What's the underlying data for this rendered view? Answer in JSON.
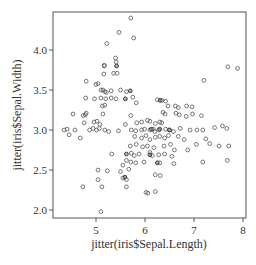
{
  "chart_data": {
    "type": "scatter",
    "title": "",
    "xlabel": "jitter(iris$Sepal.Length)",
    "ylabel": "jitter(iris$Sepal.Width)",
    "xlim": [
      4.15,
      8.06
    ],
    "ylim": [
      1.9,
      4.48
    ],
    "x_ticks": [
      5,
      6,
      7,
      8
    ],
    "x_tick_labels": [
      "5",
      "6",
      "7",
      "8"
    ],
    "y_ticks": [
      2.0,
      2.5,
      3.0,
      3.5,
      4.0
    ],
    "y_tick_labels": [
      "2.0",
      "2.5",
      "3.0",
      "3.5",
      "4.0"
    ],
    "grid": false,
    "legend": null,
    "marker": "open-circle",
    "marker_color": "#555555",
    "points": [
      [
        5.71,
        4.4
      ],
      [
        5.47,
        4.22
      ],
      [
        5.22,
        4.08
      ],
      [
        5.77,
        4.15
      ],
      [
        5.4,
        3.9
      ],
      [
        5.41,
        3.85
      ],
      [
        5.17,
        3.8
      ],
      [
        5.17,
        3.81
      ],
      [
        5.16,
        3.7
      ],
      [
        5.36,
        3.71
      ],
      [
        5.43,
        3.71
      ],
      [
        7.69,
        3.79
      ],
      [
        7.89,
        3.77
      ],
      [
        7.2,
        3.62
      ],
      [
        4.8,
        3.61
      ],
      [
        5.0,
        3.57
      ],
      [
        5.04,
        3.58
      ],
      [
        5.1,
        3.5
      ],
      [
        5.14,
        3.5
      ],
      [
        5.18,
        3.48
      ],
      [
        5.21,
        3.47
      ],
      [
        5.31,
        3.49
      ],
      [
        5.5,
        3.5
      ],
      [
        5.62,
        3.48
      ],
      [
        4.79,
        3.4
      ],
      [
        4.97,
        3.39
      ],
      [
        5.1,
        3.4
      ],
      [
        5.2,
        3.39
      ],
      [
        5.31,
        3.4
      ],
      [
        5.41,
        3.39
      ],
      [
        5.13,
        3.3
      ],
      [
        5.18,
        3.31
      ],
      [
        5.75,
        3.41
      ],
      [
        5.82,
        3.34
      ],
      [
        6.25,
        3.38
      ],
      [
        6.35,
        3.37
      ],
      [
        6.42,
        3.36
      ],
      [
        6.47,
        3.3
      ],
      [
        6.62,
        3.3
      ],
      [
        6.68,
        3.28
      ],
      [
        6.85,
        3.3
      ],
      [
        6.96,
        3.29
      ],
      [
        4.53,
        3.2
      ],
      [
        4.74,
        3.18
      ],
      [
        4.78,
        3.19
      ],
      [
        4.8,
        3.21
      ],
      [
        4.76,
        3.09
      ],
      [
        4.96,
        3.1
      ],
      [
        5.02,
        3.11
      ],
      [
        5.08,
        3.07
      ],
      [
        5.14,
        3.2
      ],
      [
        5.71,
        3.18
      ],
      [
        6.37,
        3.22
      ],
      [
        6.41,
        3.2
      ],
      [
        6.63,
        3.21
      ],
      [
        6.7,
        3.19
      ],
      [
        6.84,
        3.17
      ],
      [
        6.97,
        3.2
      ],
      [
        7.15,
        3.18
      ],
      [
        4.35,
        3.0
      ],
      [
        4.41,
        3.01
      ],
      [
        4.45,
        2.94
      ],
      [
        4.57,
        3.0
      ],
      [
        4.68,
        2.9
      ],
      [
        4.87,
        3.0
      ],
      [
        4.94,
        3.02
      ],
      [
        5.01,
        3.0
      ],
      [
        5.07,
        3.02
      ],
      [
        5.18,
        3.0
      ],
      [
        5.26,
        2.98
      ],
      [
        5.46,
        2.99
      ],
      [
        5.72,
        3.0
      ],
      [
        5.81,
        2.99
      ],
      [
        5.93,
        3.0
      ],
      [
        5.99,
        3.01
      ],
      [
        6.1,
        3.0
      ],
      [
        6.17,
        3.01
      ],
      [
        6.2,
        2.98
      ],
      [
        6.28,
        3.0
      ],
      [
        6.42,
        3.01
      ],
      [
        6.5,
        3.0
      ],
      [
        6.58,
        2.98
      ],
      [
        6.72,
        3.02
      ],
      [
        6.92,
        3.0
      ],
      [
        7.06,
        3.0
      ],
      [
        7.18,
        3.0
      ],
      [
        7.42,
        3.03
      ],
      [
        7.58,
        3.05
      ],
      [
        7.67,
        3.02
      ],
      [
        5.6,
        3.07
      ],
      [
        5.83,
        3.09
      ],
      [
        5.93,
        3.1
      ],
      [
        6.05,
        3.12
      ],
      [
        6.1,
        3.11
      ],
      [
        6.21,
        3.08
      ],
      [
        6.3,
        3.1
      ],
      [
        6.34,
        3.09
      ],
      [
        5.79,
        2.92
      ],
      [
        5.93,
        2.9
      ],
      [
        6.02,
        2.93
      ],
      [
        6.1,
        2.88
      ],
      [
        6.21,
        2.91
      ],
      [
        6.3,
        2.92
      ],
      [
        6.4,
        2.9
      ],
      [
        6.48,
        2.93
      ],
      [
        6.68,
        2.92
      ],
      [
        6.8,
        2.88
      ],
      [
        7.05,
        2.82
      ],
      [
        7.24,
        2.89
      ],
      [
        7.32,
        2.83
      ],
      [
        7.51,
        2.8
      ],
      [
        7.71,
        2.8
      ],
      [
        5.7,
        2.8
      ],
      [
        5.82,
        2.82
      ],
      [
        5.95,
        2.79
      ],
      [
        6.05,
        2.8
      ],
      [
        6.18,
        2.78
      ],
      [
        6.39,
        2.8
      ],
      [
        6.52,
        2.82
      ],
      [
        6.6,
        2.75
      ],
      [
        6.87,
        2.75
      ],
      [
        5.72,
        2.71
      ],
      [
        5.78,
        2.68
      ],
      [
        5.88,
        2.7
      ],
      [
        6.1,
        2.72
      ],
      [
        6.15,
        2.68
      ],
      [
        6.28,
        2.69
      ],
      [
        6.4,
        2.7
      ],
      [
        6.55,
        2.67
      ],
      [
        7.68,
        2.62
      ],
      [
        5.62,
        2.62
      ],
      [
        5.71,
        2.6
      ],
      [
        5.81,
        2.59
      ],
      [
        5.98,
        2.6
      ],
      [
        6.3,
        2.59
      ],
      [
        6.59,
        2.58
      ],
      [
        7.18,
        2.6
      ],
      [
        5.32,
        2.7
      ],
      [
        5.55,
        2.56
      ],
      [
        5.5,
        2.48
      ],
      [
        5.67,
        2.51
      ],
      [
        5.04,
        2.5
      ],
      [
        5.23,
        2.49
      ],
      [
        5.55,
        2.4
      ],
      [
        5.62,
        2.38
      ],
      [
        5.04,
        2.38
      ],
      [
        5.62,
        2.29
      ],
      [
        4.73,
        2.29
      ],
      [
        5.12,
        2.29
      ],
      [
        6.21,
        2.44
      ],
      [
        6.31,
        2.43
      ],
      [
        6.02,
        2.22
      ],
      [
        6.06,
        2.21
      ],
      [
        6.21,
        2.23
      ],
      [
        5.1,
        1.98
      ]
    ],
    "dense_points": [
      [
        5.42,
        3.8
      ],
      [
        5.6,
        3.39
      ],
      [
        5.7,
        3.49
      ],
      [
        6.31,
        3.37
      ],
      [
        6.13,
        3.01
      ],
      [
        6.5,
        3.0
      ],
      [
        6.3,
        3.01
      ],
      [
        5.62,
        2.7
      ],
      [
        6.1,
        2.69
      ],
      [
        6.25,
        2.59
      ],
      [
        5.59,
        2.41
      ]
    ]
  },
  "axes": {
    "x_label": "jitter(iris$Sepal.Length)",
    "y_label": "jitter(iris$Sepal.Width)"
  }
}
